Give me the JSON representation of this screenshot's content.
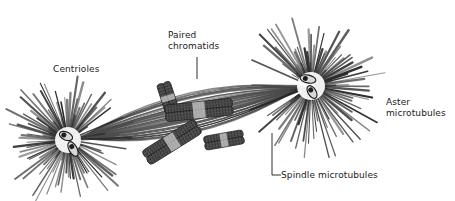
{
  "figure": {
    "background_color": "#ffffff",
    "ink_color": "#4a4a4a",
    "dark_ink_color": "#2b2b2b",
    "label_color": "#1a1a1a",
    "width": 455,
    "height": 201
  },
  "labels": {
    "centrioles": "Centrioles",
    "paired_chromatids": "Paired\nchromatids",
    "aster_microtubules": "Aster\nmicrotubules",
    "spindle_microtubules": "Spindle microtubules"
  },
  "structures": {
    "left_aster": {
      "name": "left-aster",
      "center_x": 68,
      "center_y": 140,
      "ray_count": 86,
      "ray_length_min": 26,
      "ray_length_max": 62
    },
    "right_aster": {
      "name": "right-aster",
      "center_x": 311,
      "center_y": 86,
      "ray_count": 92,
      "ray_length_min": 28,
      "ray_length_max": 68
    },
    "spindle": {
      "name": "spindle-microtubule-bundle",
      "pole_left_x": 80,
      "pole_left_y": 138,
      "pole_right_x": 300,
      "pole_right_y": 88,
      "fiber_count": 34
    },
    "chromosomes": [
      {
        "name": "chromatid-pair-upper-left",
        "cx": 168,
        "cy": 98,
        "angle": -18,
        "length": 32,
        "width": 11
      },
      {
        "name": "chromatid-pair-center",
        "cx": 199,
        "cy": 110,
        "angle": 84,
        "length": 68,
        "width": 13
      },
      {
        "name": "chromatid-pair-lower-left",
        "cx": 172,
        "cy": 142,
        "angle": 58,
        "length": 62,
        "width": 13
      },
      {
        "name": "chromatid-pair-right",
        "cx": 224,
        "cy": 140,
        "angle": 80,
        "length": 40,
        "width": 11
      }
    ],
    "centrioles_left": [
      {
        "name": "centriole-left-a",
        "cx": 66,
        "cy": 136,
        "angle": 24,
        "rx": 7,
        "ry": 4
      },
      {
        "name": "centriole-left-b",
        "cx": 73,
        "cy": 149,
        "angle": 62,
        "rx": 8,
        "ry": 4
      }
    ],
    "centrioles_right": [
      {
        "name": "centriole-right-a",
        "cx": 308,
        "cy": 79,
        "angle": 12,
        "rx": 8,
        "ry": 4
      },
      {
        "name": "centriole-right-b",
        "cx": 312,
        "cy": 92,
        "angle": 58,
        "rx": 7,
        "ry": 4
      }
    ]
  },
  "leader_lines": {
    "paired_chromatids": {
      "x1": 197,
      "y1": 57,
      "x2": 197,
      "y2": 79
    },
    "spindle_microtubules": {
      "x1": 272,
      "y1": 133,
      "x2": 272,
      "y2": 175,
      "x3": 281,
      "y3": 175
    }
  }
}
